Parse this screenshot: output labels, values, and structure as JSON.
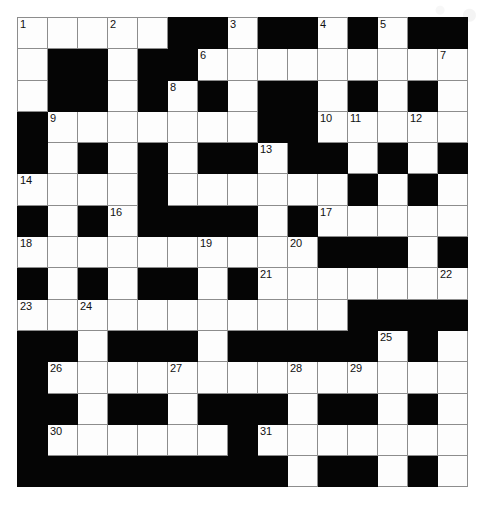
{
  "puzzle": {
    "title": "Crossword Grid",
    "type": "crossword",
    "rows": 15,
    "cols": 15,
    "cell_size_px": 30,
    "colors": {
      "block": "#050505",
      "light": "#fdfdfd",
      "gridline": "#8d8d8d",
      "number_text": "#111111",
      "page_background": "#ffffff"
    },
    "legend": {
      "block_char": "#",
      "light_char": "."
    },
    "grid_pattern": [
      ".....##.##.#.##",
      ".##.##.........",
      ".##.#.#.##.#.#.",
      "#.......##.....",
      "#.#.#.##.##.#.#",
      "....#......#.#.",
      "#.#.####.#.....",
      "..........###.#",
      "#.#.##.#.......",
      "...........####",
      "##.###.#####.#.",
      "#..............",
      "##.##.###.##.#.",
      "#......#.......",
      "#########.##.#."
    ],
    "numbers": [
      {
        "n": 1,
        "row": 0,
        "col": 0
      },
      {
        "n": 2,
        "row": 0,
        "col": 3
      },
      {
        "n": 3,
        "row": 0,
        "col": 7
      },
      {
        "n": 4,
        "row": 0,
        "col": 10
      },
      {
        "n": 5,
        "row": 0,
        "col": 12
      },
      {
        "n": 6,
        "row": 1,
        "col": 6
      },
      {
        "n": 7,
        "row": 1,
        "col": 14
      },
      {
        "n": 8,
        "row": 2,
        "col": 5
      },
      {
        "n": 9,
        "row": 3,
        "col": 1
      },
      {
        "n": 10,
        "row": 3,
        "col": 10
      },
      {
        "n": 11,
        "row": 3,
        "col": 11
      },
      {
        "n": 12,
        "row": 3,
        "col": 13
      },
      {
        "n": 13,
        "row": 4,
        "col": 8
      },
      {
        "n": 14,
        "row": 5,
        "col": 0
      },
      {
        "n": 15,
        "row": 5,
        "col": 4
      },
      {
        "n": 16,
        "row": 6,
        "col": 3
      },
      {
        "n": 17,
        "row": 6,
        "col": 10
      },
      {
        "n": 18,
        "row": 7,
        "col": 0
      },
      {
        "n": 19,
        "row": 7,
        "col": 6
      },
      {
        "n": 20,
        "row": 7,
        "col": 9
      },
      {
        "n": 21,
        "row": 8,
        "col": 8
      },
      {
        "n": 22,
        "row": 8,
        "col": 14
      },
      {
        "n": 23,
        "row": 9,
        "col": 0
      },
      {
        "n": 24,
        "row": 9,
        "col": 2
      },
      {
        "n": 25,
        "row": 10,
        "col": 12
      },
      {
        "n": 26,
        "row": 11,
        "col": 1
      },
      {
        "n": 27,
        "row": 11,
        "col": 5
      },
      {
        "n": 28,
        "row": 11,
        "col": 9
      },
      {
        "n": 29,
        "row": 11,
        "col": 11
      },
      {
        "n": 30,
        "row": 13,
        "col": 1
      },
      {
        "n": 31,
        "row": 13,
        "col": 8
      }
    ],
    "entries": []
  }
}
